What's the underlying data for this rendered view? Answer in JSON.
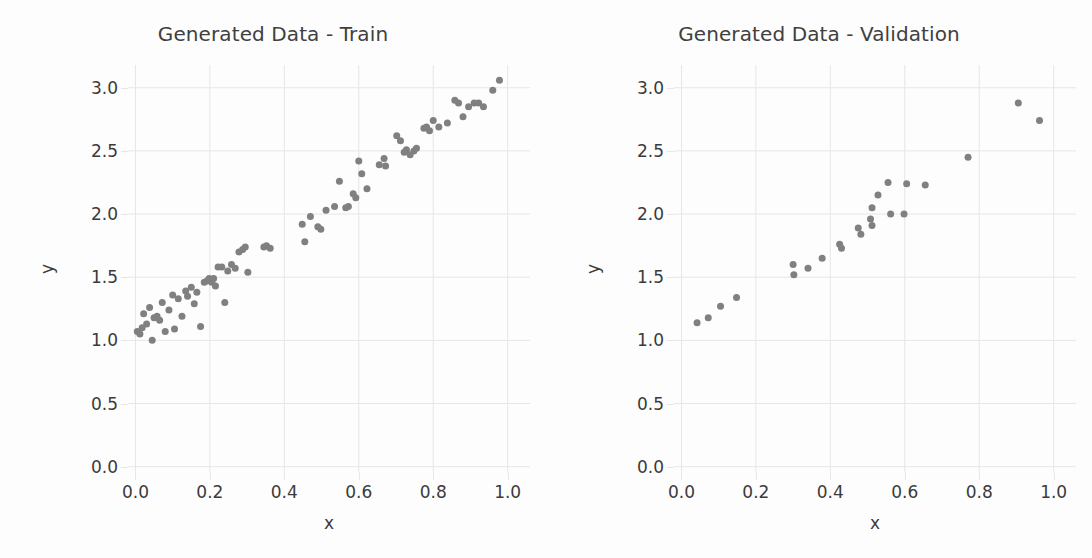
{
  "figure": {
    "background": "#fdfdfd",
    "width": 1092,
    "height": 558
  },
  "style": {
    "marker_color": "#808080",
    "grid_color": "#e6e6e6",
    "text_color": "#3b3b3b",
    "title_color": "#404040",
    "marker_size_px": 7
  },
  "panels": {
    "left": {
      "title": "Generated Data - Train",
      "xlabel": "x",
      "ylabel": "y"
    },
    "right": {
      "title": "Generated Data - Validation",
      "xlabel": "x",
      "ylabel": "y"
    }
  },
  "axes": {
    "xticks": [
      "0.0",
      "0.2",
      "0.4",
      "0.6",
      "0.8",
      "1.0"
    ],
    "xtick_values": [
      0.0,
      0.2,
      0.4,
      0.6,
      0.8,
      1.0
    ],
    "yticks": [
      "0.0",
      "0.5",
      "1.0",
      "1.5",
      "2.0",
      "2.5",
      "3.0"
    ],
    "ytick_values": [
      0.0,
      0.5,
      1.0,
      1.5,
      2.0,
      2.5,
      3.0
    ],
    "xlim": [
      -0.02,
      1.06
    ],
    "ylim": [
      -0.05,
      3.18
    ]
  },
  "chart_data": [
    {
      "type": "scatter",
      "title": "Generated Data - Train",
      "xlabel": "x",
      "ylabel": "y",
      "xlim": [
        -0.02,
        1.06
      ],
      "ylim": [
        -0.05,
        3.18
      ],
      "xticks": [
        0.0,
        0.2,
        0.4,
        0.6,
        0.8,
        1.0
      ],
      "yticks": [
        0.0,
        0.5,
        1.0,
        1.5,
        2.0,
        2.5,
        3.0
      ],
      "grid": true,
      "legend": "none",
      "marker_color": "#808080",
      "n_points": 80,
      "points": [
        [
          0.005,
          1.07
        ],
        [
          0.012,
          1.05
        ],
        [
          0.018,
          1.1
        ],
        [
          0.022,
          1.21
        ],
        [
          0.03,
          1.13
        ],
        [
          0.038,
          1.26
        ],
        [
          0.045,
          1.0
        ],
        [
          0.05,
          1.18
        ],
        [
          0.058,
          1.19
        ],
        [
          0.065,
          1.16
        ],
        [
          0.072,
          1.3
        ],
        [
          0.08,
          1.07
        ],
        [
          0.09,
          1.24
        ],
        [
          0.1,
          1.36
        ],
        [
          0.105,
          1.09
        ],
        [
          0.115,
          1.33
        ],
        [
          0.125,
          1.19
        ],
        [
          0.135,
          1.39
        ],
        [
          0.14,
          1.35
        ],
        [
          0.15,
          1.42
        ],
        [
          0.158,
          1.29
        ],
        [
          0.165,
          1.38
        ],
        [
          0.175,
          1.11
        ],
        [
          0.185,
          1.46
        ],
        [
          0.192,
          1.47
        ],
        [
          0.198,
          1.49
        ],
        [
          0.205,
          1.46
        ],
        [
          0.21,
          1.49
        ],
        [
          0.215,
          1.43
        ],
        [
          0.222,
          1.58
        ],
        [
          0.232,
          1.58
        ],
        [
          0.24,
          1.3
        ],
        [
          0.248,
          1.55
        ],
        [
          0.258,
          1.6
        ],
        [
          0.268,
          1.57
        ],
        [
          0.278,
          1.7
        ],
        [
          0.288,
          1.72
        ],
        [
          0.295,
          1.74
        ],
        [
          0.302,
          1.54
        ],
        [
          0.345,
          1.74
        ],
        [
          0.352,
          1.75
        ],
        [
          0.362,
          1.73
        ],
        [
          0.448,
          1.92
        ],
        [
          0.455,
          1.78
        ],
        [
          0.47,
          1.98
        ],
        [
          0.49,
          1.9
        ],
        [
          0.498,
          1.88
        ],
        [
          0.512,
          2.03
        ],
        [
          0.535,
          2.06
        ],
        [
          0.548,
          2.26
        ],
        [
          0.565,
          2.05
        ],
        [
          0.572,
          2.06
        ],
        [
          0.585,
          2.16
        ],
        [
          0.592,
          2.13
        ],
        [
          0.6,
          2.42
        ],
        [
          0.608,
          2.32
        ],
        [
          0.622,
          2.2
        ],
        [
          0.655,
          2.39
        ],
        [
          0.668,
          2.44
        ],
        [
          0.672,
          2.38
        ],
        [
          0.702,
          2.62
        ],
        [
          0.712,
          2.58
        ],
        [
          0.722,
          2.49
        ],
        [
          0.728,
          2.51
        ],
        [
          0.738,
          2.47
        ],
        [
          0.748,
          2.5
        ],
        [
          0.755,
          2.52
        ],
        [
          0.775,
          2.68
        ],
        [
          0.782,
          2.69
        ],
        [
          0.79,
          2.66
        ],
        [
          0.8,
          2.74
        ],
        [
          0.815,
          2.69
        ],
        [
          0.838,
          2.72
        ],
        [
          0.858,
          2.9
        ],
        [
          0.868,
          2.88
        ],
        [
          0.88,
          2.77
        ],
        [
          0.895,
          2.85
        ],
        [
          0.91,
          2.88
        ],
        [
          0.922,
          2.88
        ],
        [
          0.935,
          2.85
        ],
        [
          0.96,
          2.98
        ],
        [
          0.978,
          3.06
        ]
      ]
    },
    {
      "type": "scatter",
      "title": "Generated Data - Validation",
      "xlabel": "x",
      "ylabel": "y",
      "xlim": [
        -0.02,
        1.06
      ],
      "ylim": [
        -0.05,
        3.18
      ],
      "xticks": [
        0.0,
        0.2,
        0.4,
        0.6,
        0.8,
        1.0
      ],
      "yticks": [
        0.0,
        0.5,
        1.0,
        1.5,
        2.0,
        2.5,
        3.0
      ],
      "grid": true,
      "legend": "none",
      "marker_color": "#808080",
      "n_points": 22,
      "points": [
        [
          0.042,
          1.14
        ],
        [
          0.072,
          1.18
        ],
        [
          0.105,
          1.27
        ],
        [
          0.148,
          1.34
        ],
        [
          0.3,
          1.6
        ],
        [
          0.302,
          1.52
        ],
        [
          0.34,
          1.57
        ],
        [
          0.378,
          1.65
        ],
        [
          0.425,
          1.76
        ],
        [
          0.43,
          1.73
        ],
        [
          0.475,
          1.89
        ],
        [
          0.482,
          1.84
        ],
        [
          0.512,
          2.05
        ],
        [
          0.508,
          1.96
        ],
        [
          0.512,
          1.91
        ],
        [
          0.528,
          2.15
        ],
        [
          0.555,
          2.25
        ],
        [
          0.562,
          2.0
        ],
        [
          0.598,
          2.0
        ],
        [
          0.605,
          2.24
        ],
        [
          0.655,
          2.23
        ],
        [
          0.77,
          2.45
        ],
        [
          0.905,
          2.88
        ],
        [
          0.962,
          2.74
        ]
      ]
    }
  ]
}
